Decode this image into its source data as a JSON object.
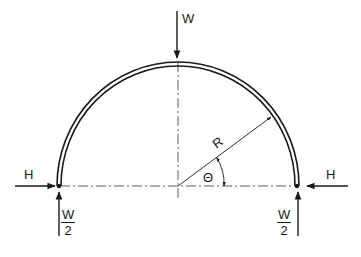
{
  "figure": {
    "type": "semicircular arch / ring free-body diagram",
    "labels": {
      "top_load": "W",
      "left_horizontal": "H",
      "right_horizontal": "H",
      "radius": "R",
      "angle": "Θ",
      "left_reaction_num": "W",
      "left_reaction_den": "2",
      "right_reaction_num": "W",
      "right_reaction_den": "2"
    },
    "colors": {
      "ink": "#1a1a1a",
      "background": "#ffffff"
    }
  }
}
